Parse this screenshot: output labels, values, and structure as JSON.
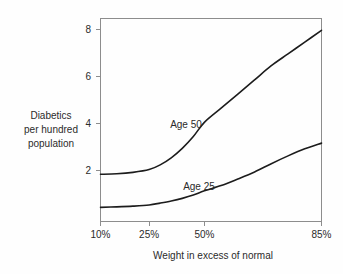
{
  "chart_data": {
    "type": "line",
    "title": "",
    "subtitle": "",
    "xlabel": "Weight in excess of normal",
    "ylabel": "Diabetics per hundred population",
    "ylabel_lines": [
      "Diabetics",
      "per hundred",
      "population"
    ],
    "grid": false,
    "legend_position": "inline-annotations",
    "x_tick_labels": [
      "10%",
      "25%",
      "50%",
      "85%"
    ],
    "x_tick_values": [
      10,
      25,
      50,
      85
    ],
    "y_tick_labels": [
      "2",
      "4",
      "6",
      "8"
    ],
    "y_tick_values": [
      2,
      4,
      6,
      8
    ],
    "xlim": [
      10,
      85
    ],
    "ylim": [
      0,
      8.6
    ],
    "x_scale_note": "non-linear: tick positions at 0%, 22%, 47%, 100% of axis width",
    "x_tick_fractions": [
      0.0,
      0.22,
      0.47,
      1.0
    ],
    "series": [
      {
        "name": "Age 50",
        "label": "Age 50",
        "color": "#1c1c1c",
        "x": [
          10,
          15,
          20,
          25,
          30,
          35,
          40,
          45,
          50,
          55,
          60,
          65,
          70,
          75,
          80,
          85
        ],
        "values": [
          2.0,
          2.02,
          2.08,
          2.2,
          2.4,
          2.7,
          3.1,
          3.6,
          4.2,
          4.8,
          5.4,
          6.0,
          6.6,
          7.1,
          7.6,
          8.1
        ],
        "label_x": 40,
        "label_y": 3.95
      },
      {
        "name": "Age 25",
        "label": "Age 25",
        "color": "#1c1c1c",
        "x": [
          10,
          15,
          20,
          25,
          30,
          35,
          40,
          45,
          50,
          55,
          60,
          65,
          70,
          75,
          80,
          85
        ],
        "values": [
          0.6,
          0.62,
          0.65,
          0.7,
          0.78,
          0.87,
          0.98,
          1.12,
          1.3,
          1.52,
          1.8,
          2.1,
          2.45,
          2.78,
          3.08,
          3.32
        ],
        "label_x": 47,
        "label_y": 1.72
      }
    ],
    "annotations": [
      {
        "text": "Age 50",
        "x": 40,
        "y": 3.95
      },
      {
        "text": "Age 25",
        "x": 47,
        "y": 1.72
      }
    ],
    "colors": {
      "background": "#fefefe",
      "frame": "#8d8d8d",
      "curve": "#1c1c1c",
      "text": "#2b2b2b"
    }
  }
}
